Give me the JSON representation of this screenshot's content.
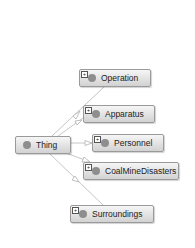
{
  "diagram": {
    "type": "ontology-class-hierarchy",
    "root": {
      "label": "Thing",
      "icon": "class-circle-icon"
    },
    "children": [
      {
        "label": "Operation",
        "icon": "class-circle-icon",
        "expand": "+"
      },
      {
        "label": "Apparatus",
        "icon": "class-circle-icon",
        "expand": "+"
      },
      {
        "label": "Personnel",
        "icon": "class-circle-icon",
        "expand": "+"
      },
      {
        "label": "CoalMineDisasters",
        "icon": "class-circle-icon",
        "expand": "+"
      },
      {
        "label": "Surroundings",
        "icon": "class-circle-icon",
        "expand": "+"
      }
    ],
    "colors": {
      "node_border": "#9a9a9a",
      "node_fill_top": "#f6f6f6",
      "node_fill_bottom": "#d2d2d2",
      "class_dot": "#8e8e8e",
      "edge": "#b5b5b5"
    }
  }
}
